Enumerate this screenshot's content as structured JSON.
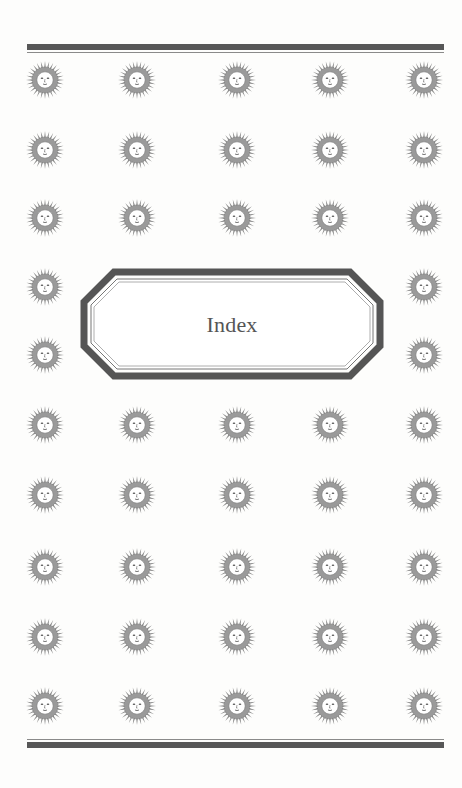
{
  "page": {
    "title": "Index",
    "colors": {
      "background": "#fdfdfc",
      "rule": "#575757",
      "frame": "#555555",
      "title_text": "#555555",
      "sun_rays": "#8c8c8c",
      "sun_face": "#ffffff"
    }
  },
  "ornaments": {
    "icon": "sun-face-icon",
    "columns_x": [
      45,
      137,
      237,
      330,
      424
    ],
    "rows_y": [
      80,
      150,
      218,
      287,
      355,
      425,
      495,
      567,
      637,
      706
    ],
    "rows_with_frame_gap": [
      3,
      4
    ],
    "count": 44
  },
  "rules": {
    "top": {
      "y": 44
    },
    "bottom": {
      "y": 739
    }
  }
}
